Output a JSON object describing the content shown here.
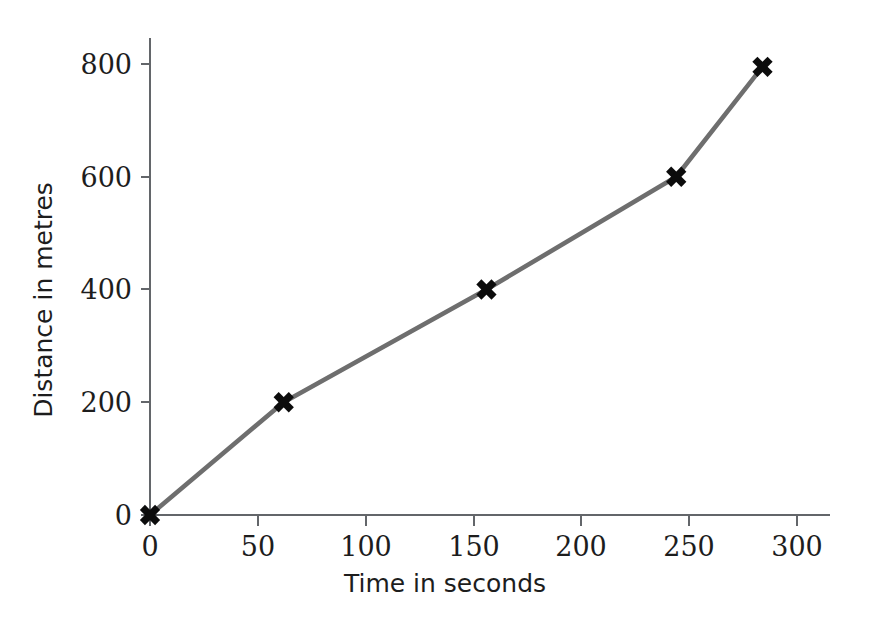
{
  "chart_data": {
    "type": "line",
    "title": "",
    "subtitle": "",
    "xlabel": "Time in seconds",
    "ylabel": "Distance in metres",
    "x": [
      0,
      62,
      156,
      244,
      284
    ],
    "values": [
      0,
      200,
      400,
      600,
      795
    ],
    "series": [
      {
        "name": "Distance travelled",
        "x": [
          0,
          62,
          156,
          244,
          284
        ],
        "values": [
          0,
          200,
          400,
          600,
          795
        ]
      }
    ],
    "xlim": [
      0,
      315
    ],
    "ylim": [
      0,
      845
    ],
    "xticks": [
      0,
      50,
      100,
      150,
      200,
      250,
      300
    ],
    "xtick_labels": [
      "0",
      "50",
      "100",
      "150",
      "200",
      "250",
      "300"
    ],
    "yticks": [
      0,
      200,
      400,
      600,
      800
    ],
    "ytick_labels": [
      "0",
      "200",
      "400",
      "600",
      "800"
    ],
    "grid": false,
    "legend": false,
    "legend_position": "none",
    "marker": "x",
    "marker_color": "#0c0c0c",
    "line_color": "#6e6e6e",
    "axis_color": "#63666a",
    "background_color": "#ffffff",
    "annotations": []
  },
  "axis_labels": {
    "x_title": "Time in seconds",
    "y_title": "Distance in metres"
  }
}
